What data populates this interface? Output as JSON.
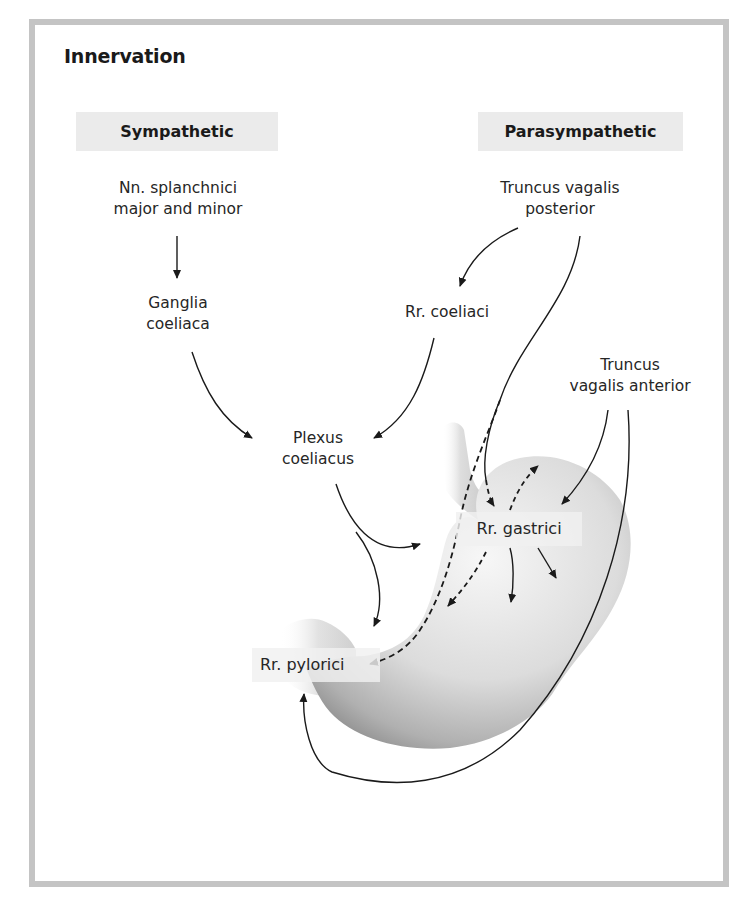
{
  "figure": {
    "title": "Innervation",
    "columns": {
      "sympathetic": "Sympathetic",
      "parasympathetic": "Parasympathetic"
    },
    "labels": {
      "nn_splanchnici": [
        "Nn. splanchnici",
        "major and minor"
      ],
      "ganglia_coeliaca": [
        "Ganglia",
        "coeliaca"
      ],
      "plexus_coeliacus": [
        "Plexus",
        "coeliacus"
      ],
      "truncus_posterior": [
        "Truncus vagalis",
        "posterior"
      ],
      "rr_coeliaci": "Rr. coeliaci",
      "truncus_anterior": [
        "Truncus",
        "vagalis anterior"
      ],
      "rr_gastrici": "Rr. gastrici",
      "rr_pylorici": "Rr. pylorici"
    },
    "colors": {
      "frame_border": "#c4c4c4",
      "header_box": "#ebebeb",
      "arrow": "#1a1a1a",
      "stomach_light": "#f2f2f2",
      "stomach_dark": "#8c8c8c"
    }
  }
}
